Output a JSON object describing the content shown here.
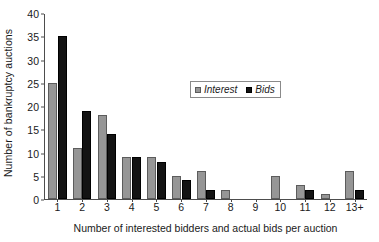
{
  "chart_data": {
    "type": "bar",
    "title": "",
    "xlabel": "Number of interested bidders and actual bids per auction",
    "ylabel": "Number of bankruptcy auctions",
    "categories": [
      "1",
      "2",
      "3",
      "4",
      "5",
      "6",
      "7",
      "8",
      "9",
      "10",
      "11",
      "12",
      "13+"
    ],
    "series": [
      {
        "name": "Interest",
        "color": "#969696",
        "values": [
          25,
          11,
          18,
          9,
          9,
          5,
          6,
          2,
          0,
          5,
          3,
          1,
          6
        ]
      },
      {
        "name": "Bids",
        "color": "#131313",
        "values": [
          35,
          19,
          14,
          9,
          8,
          4,
          2,
          0,
          0,
          0,
          2,
          0,
          2
        ]
      }
    ],
    "ylim": [
      0,
      40
    ],
    "ytick_values": [
      0,
      5,
      10,
      15,
      20,
      25,
      30,
      35,
      40
    ],
    "ytick_labels": [
      "0",
      "5",
      "10",
      "15",
      "20",
      "25",
      "30",
      "35",
      "40"
    ],
    "grid": false,
    "legend_position": "upper-center-inside"
  },
  "legend": {
    "entries": [
      {
        "label": "Interest",
        "swatch": "gray-square-swatch"
      },
      {
        "label": "Bids",
        "swatch": "black-square-swatch"
      }
    ]
  }
}
